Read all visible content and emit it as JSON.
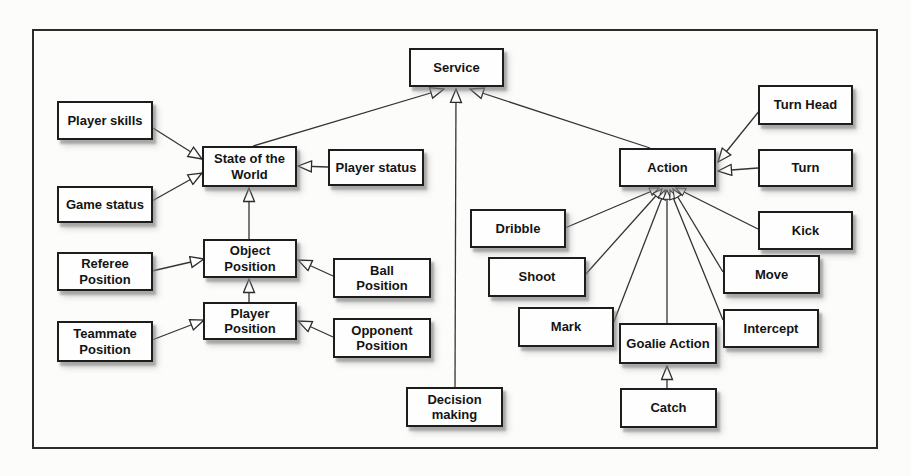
{
  "diagram": {
    "type": "uml-generalization-diagram",
    "nodes": {
      "service": {
        "label": "Service"
      },
      "player_skills": {
        "label": "Player skills"
      },
      "state_of_the_world": {
        "label": "State of the\nWorld"
      },
      "player_status": {
        "label": "Player status"
      },
      "game_status": {
        "label": "Game status"
      },
      "referee_position": {
        "label": "Referee\nPosition"
      },
      "object_position": {
        "label": "Object\nPosition"
      },
      "ball_position": {
        "label": "Ball\nPosition"
      },
      "teammate_position": {
        "label": "Teammate\nPosition"
      },
      "player_position": {
        "label": "Player\nPosition"
      },
      "opponent_position": {
        "label": "Opponent\nPosition"
      },
      "decision_making": {
        "label": "Decision\nmaking"
      },
      "action": {
        "label": "Action"
      },
      "turn_head": {
        "label": "Turn Head"
      },
      "turn": {
        "label": "Turn"
      },
      "dribble": {
        "label": "Dribble"
      },
      "kick": {
        "label": "Kick"
      },
      "shoot": {
        "label": "Shoot"
      },
      "move": {
        "label": "Move"
      },
      "mark": {
        "label": "Mark"
      },
      "intercept": {
        "label": "Intercept"
      },
      "goalie_action": {
        "label": "Goalie Action"
      },
      "catch": {
        "label": "Catch"
      }
    },
    "edges": [
      {
        "from": "Player skills",
        "to": "State of the World"
      },
      {
        "from": "Game status",
        "to": "State of the World"
      },
      {
        "from": "Player status",
        "to": "State of the World"
      },
      {
        "from": "Object Position",
        "to": "State of the World"
      },
      {
        "from": "Referee Position",
        "to": "Object Position"
      },
      {
        "from": "Ball Position",
        "to": "Object Position"
      },
      {
        "from": "Player Position",
        "to": "Object Position"
      },
      {
        "from": "Teammate Position",
        "to": "Player Position"
      },
      {
        "from": "Opponent Position",
        "to": "Player Position"
      },
      {
        "from": "State of the World",
        "to": "Service"
      },
      {
        "from": "Decision making",
        "to": "Service"
      },
      {
        "from": "Action",
        "to": "Service"
      },
      {
        "from": "Turn Head",
        "to": "Action"
      },
      {
        "from": "Turn",
        "to": "Action"
      },
      {
        "from": "Dribble",
        "to": "Action"
      },
      {
        "from": "Shoot",
        "to": "Action"
      },
      {
        "from": "Mark",
        "to": "Action"
      },
      {
        "from": "Goalie Action",
        "to": "Action"
      },
      {
        "from": "Intercept",
        "to": "Action"
      },
      {
        "from": "Move",
        "to": "Action"
      },
      {
        "from": "Kick",
        "to": "Action"
      },
      {
        "from": "Catch",
        "to": "Goalie Action"
      }
    ],
    "colors": {
      "background": "#fcfcfa",
      "box_fill": "#fefefe",
      "box_border": "#1d1d1d",
      "line": "#343434",
      "shadow": "#8a8a8a"
    }
  }
}
